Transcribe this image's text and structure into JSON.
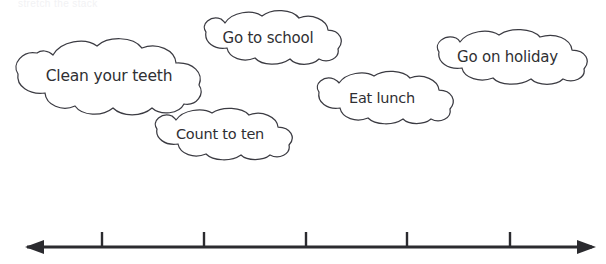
{
  "page": {
    "background_color": "#ffffff",
    "width": 606,
    "height": 264,
    "instruction_partial": "stretch the stack",
    "ink_color": "#3b3b42",
    "text_color": "#2f2f33",
    "axis_color": "#2b2b2f"
  },
  "clouds": [
    {
      "id": "clean-your-teeth",
      "label": "Clean your teeth",
      "x": 9,
      "y": 37,
      "width": 200,
      "height": 78,
      "font_size": 15.5
    },
    {
      "id": "go-to-school",
      "label": "Go to school",
      "x": 192,
      "y": 10,
      "width": 152,
      "height": 55,
      "font_size": 15
    },
    {
      "id": "count-to-ten",
      "label": "Count to ten",
      "x": 144,
      "y": 108,
      "width": 152,
      "height": 52,
      "font_size": 14.5
    },
    {
      "id": "eat-lunch",
      "label": "Eat lunch",
      "x": 307,
      "y": 71,
      "width": 150,
      "height": 53,
      "font_size": 14.5
    },
    {
      "id": "go-on-holiday",
      "label": "Go on holiday",
      "x": 424,
      "y": 29,
      "width": 167,
      "height": 55,
      "font_size": 15
    }
  ],
  "number_line": {
    "id": "timeline-axis",
    "axis_y": 247,
    "left_end": 25,
    "right_end": 596,
    "arrow_left": true,
    "arrow_right": true,
    "tick_count": 5,
    "tick_positions": [
      102,
      204,
      306,
      407,
      510
    ],
    "tick_height": 16,
    "tick_labels": [
      "",
      "",
      "",
      "",
      ""
    ]
  }
}
